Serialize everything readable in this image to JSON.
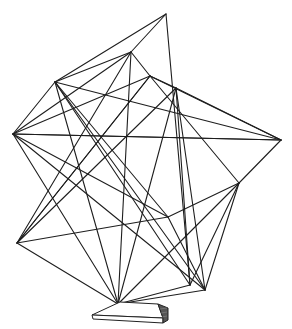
{
  "image": {
    "subject": "line drawing of a geometric wire sculpture on a small pedestal base",
    "stroke_color": "#1e1e1e",
    "background": "#ffffff",
    "vertices": {
      "top": [
        166,
        14
      ],
      "A": [
        131,
        52
      ],
      "F": [
        150,
        76
      ],
      "B": [
        55,
        82
      ],
      "D": [
        176,
        88
      ],
      "C": [
        13,
        134
      ],
      "E": [
        281,
        140
      ],
      "G": [
        239,
        183
      ],
      "H": [
        168,
        217
      ],
      "L": [
        17,
        243
      ],
      "I": [
        190,
        285
      ],
      "J": [
        205,
        290
      ],
      "K": [
        118,
        304
      ]
    },
    "edges": [
      [
        "top",
        "B"
      ],
      [
        "top",
        "A"
      ],
      [
        "top",
        "I"
      ],
      [
        "A",
        "B"
      ],
      [
        "A",
        "F"
      ],
      [
        "A",
        "K"
      ],
      [
        "A",
        "L"
      ],
      [
        "B",
        "C"
      ],
      [
        "B",
        "E"
      ],
      [
        "B",
        "H"
      ],
      [
        "B",
        "I"
      ],
      [
        "B",
        "J"
      ],
      [
        "B",
        "K"
      ],
      [
        "C",
        "A"
      ],
      [
        "C",
        "E"
      ],
      [
        "C",
        "K"
      ],
      [
        "C",
        "J"
      ],
      [
        "C",
        "F"
      ],
      [
        "F",
        "D"
      ],
      [
        "F",
        "G"
      ],
      [
        "F",
        "L"
      ],
      [
        "D",
        "E"
      ],
      [
        "D",
        "I"
      ],
      [
        "D",
        "J"
      ],
      [
        "D",
        "K"
      ],
      [
        "D",
        "L"
      ],
      [
        "E",
        "G"
      ],
      [
        "E",
        "C"
      ],
      [
        "E",
        "F"
      ],
      [
        "G",
        "H"
      ],
      [
        "G",
        "I"
      ],
      [
        "G",
        "J"
      ],
      [
        "G",
        "K"
      ],
      [
        "H",
        "C"
      ],
      [
        "H",
        "J"
      ],
      [
        "H",
        "L"
      ],
      [
        "L",
        "K"
      ],
      [
        "L",
        "F"
      ],
      [
        "K",
        "J"
      ],
      [
        "K",
        "I"
      ]
    ]
  }
}
